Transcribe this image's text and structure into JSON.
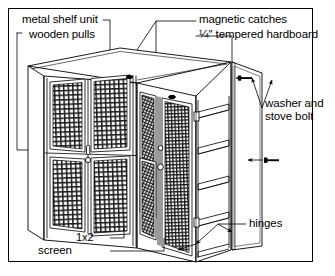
{
  "figure": {
    "type": "technical-line-illustration",
    "border_color": "#000000",
    "line_color": "#000000",
    "background_color": "#ffffff"
  },
  "labels": {
    "metal_shelf_unit": "metal shelf unit",
    "wooden_pulls": "wooden pulls",
    "magnetic_catches": "magnetic catches",
    "tempered_hardboard": "¼″ tempered hardboard",
    "washer_and_stove_bolt_line1": "washer and",
    "washer_and_stove_bolt_line2": "stove bolt",
    "hinges": "hinges",
    "one_by_two": "1x2",
    "screen": "screen"
  },
  "parts": [
    {
      "name": "metal shelf unit",
      "callout": "upper-left"
    },
    {
      "name": "wooden pulls",
      "callout": "upper-left"
    },
    {
      "name": "magnetic catches",
      "callout": "upper-right"
    },
    {
      "name": "¼″ tempered hardboard",
      "callout": "upper-right"
    },
    {
      "name": "washer and stove bolt",
      "callout": "middle-right"
    },
    {
      "name": "hinges",
      "callout": "lower-right"
    },
    {
      "name": "1x2",
      "callout": "lower-left"
    },
    {
      "name": "screen",
      "callout": "lower-left"
    }
  ],
  "drawing": {
    "cabinet": {
      "description": "isometric cabinet with four screened door panels on the front face",
      "screened_panels": 4,
      "open_door": "hardboard door swung open at right",
      "shelves_visible": 5
    },
    "fasteners": {
      "bolt_symbols": 2,
      "hinge_arrows": 2,
      "catch_arrows": 2
    }
  }
}
